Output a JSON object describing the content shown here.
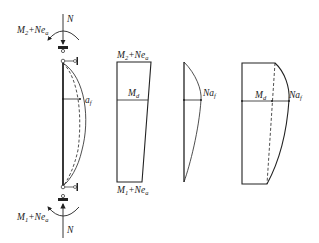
{
  "figure": {
    "panels": [
      {
        "id": "column",
        "description": "Pin-ended column with eccentric axial load, showing deflected shape",
        "labels": {
          "axial_top": "N",
          "moment_top_main": "M",
          "moment_top_sub": "2",
          "moment_top_rest": "+Ne",
          "moment_top_rest_sub": "a",
          "axial_bottom": "N",
          "moment_bottom_main": "M",
          "moment_bottom_sub": "1",
          "moment_bottom_rest": "+Ne",
          "moment_bottom_rest_sub": "a",
          "deflection_main": "a",
          "deflection_sub": "f"
        }
      },
      {
        "id": "first-order-moment",
        "description": "First-order moment diagram (trapezoid)",
        "labels": {
          "top_main": "M",
          "top_sub": "2",
          "top_rest": "+Ne",
          "top_rest_sub": "a",
          "mid_main": "M",
          "mid_sub": "d",
          "bottom_main": "M",
          "bottom_sub": "1",
          "bottom_rest": "+Ne",
          "bottom_rest_sub": "a"
        }
      },
      {
        "id": "second-order-moment",
        "description": "Second-order moment diagram (curved)",
        "labels": {
          "mid_main": "Na",
          "mid_sub": "f"
        }
      },
      {
        "id": "total-moment",
        "description": "Total moment diagram",
        "labels": {
          "mid_left_main": "M",
          "mid_left_sub": "d",
          "mid_right_main": "Na",
          "mid_right_sub": "f"
        }
      }
    ]
  }
}
